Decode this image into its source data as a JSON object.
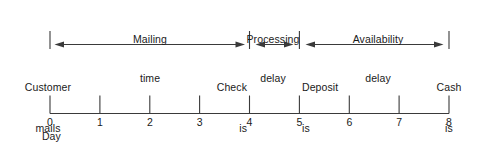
{
  "diagram": {
    "axis": {
      "name": "Day",
      "ticks": [
        "0",
        "1",
        "2",
        "3",
        "4",
        "5",
        "6",
        "7",
        "8"
      ],
      "min": 0,
      "max": 8
    },
    "spans": [
      {
        "id": "mailing",
        "label_line1": "Mailing",
        "label_line2": "time",
        "start_day": 0,
        "end_day": 4,
        "arrow": "double"
      },
      {
        "id": "processing",
        "label_line1": "Processing",
        "label_line2": "delay",
        "start_day": 4,
        "end_day": 5,
        "arrow": "double"
      },
      {
        "id": "availability",
        "label_line1": "Availability",
        "label_line2": "delay",
        "start_day": 5,
        "end_day": 8,
        "arrow": "double"
      }
    ],
    "events": [
      {
        "id": "customer-mails-check",
        "day": 0,
        "line1": "Customer",
        "line2": "mails",
        "line3": "check",
        "align": "center"
      },
      {
        "id": "check-is-received",
        "day": 4,
        "line1": "Check",
        "line2": "is",
        "line3": "received",
        "align": "right"
      },
      {
        "id": "deposit-is-made",
        "day": 5,
        "line1": "Deposit",
        "line2": "is",
        "line3": "made",
        "align": "left"
      },
      {
        "id": "cash-is-available",
        "day": 8,
        "line1": "Cash",
        "line2": "is",
        "line3": "available",
        "align": "center"
      }
    ],
    "colors": {
      "line": "#3a3a3a",
      "text": "#1a1a1a",
      "background": "#ffffff"
    }
  }
}
